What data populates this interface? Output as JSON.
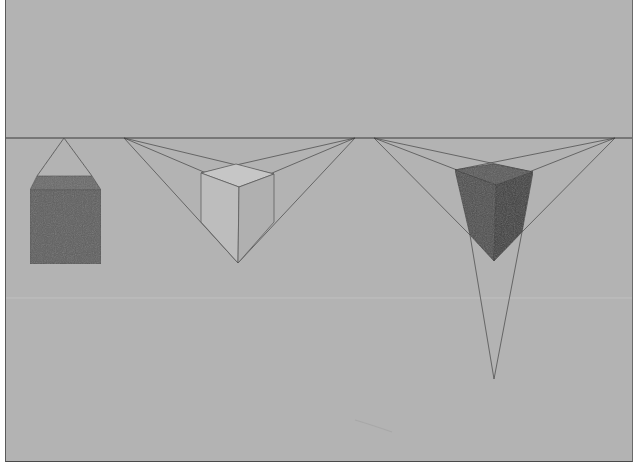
{
  "image": {
    "subject": "Pencil drawing of cubes in one-, two-, and three-point perspective on gray paper",
    "colors": {
      "paper": "#b3b3b3",
      "line": "#3c3c3c",
      "dark_fill": "#5e5e5e",
      "dark_top": "#6a6a6a",
      "light_face_left": "#bdbdbd",
      "light_face_right": "#b0b0b0",
      "light_top": "#c6c6c6",
      "cube3_left": "#4f4f4f",
      "cube3_right": "#3f3f3f",
      "cube3_top": "#5a5a5a"
    },
    "figures": [
      {
        "name": "one-point-perspective-cube",
        "shading": "dark"
      },
      {
        "name": "two-point-perspective-cube",
        "shading": "light"
      },
      {
        "name": "three-point-perspective-cube",
        "shading": "dark"
      }
    ]
  }
}
